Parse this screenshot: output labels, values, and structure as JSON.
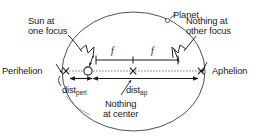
{
  "diagram": {
    "type": "geometry-diagram",
    "stroke_color": "#1a1a1a",
    "background_color": "#ffffff",
    "labels": {
      "sun": "Sun at\none focus",
      "sun_line1": "Sun at",
      "sun_line2": "one focus",
      "planet": "Planet",
      "nothing_other_focus_line1": "Nothing at",
      "nothing_other_focus_line2": "other focus",
      "perihelion": "Perihelion",
      "aphelion": "Aphelion",
      "dist_peri_base": "dist",
      "dist_peri_sub": "peri",
      "dist_ap_base": "dist",
      "dist_ap_sub": "ap",
      "nothing_center_line1": "Nothing",
      "nothing_center_line2": "at center",
      "focal_distance_left": "f",
      "focal_distance_right": "f"
    },
    "markers": {
      "sun_symbol": "open-circle",
      "planet_symbol": "open-circle",
      "center_symbol": "x-cross",
      "perihelion_symbol": "x-cross",
      "aphelion_symbol": "x-cross",
      "other_focus_symbol": "x-cross"
    },
    "geometry": {
      "ellipse_center_x": 133.5,
      "ellipse_center_y": 71.5,
      "ellipse_semi_major": 71.5,
      "ellipse_semi_minor": 59.5,
      "axis_y": 74,
      "left_focus_x": 88,
      "right_focus_x": 178,
      "perihelion_x": 66,
      "aphelion_x": 201,
      "planet_x": 168,
      "planet_y": 20,
      "f_bar_y": 60,
      "f_bar_left_x": 96,
      "f_bar_right_x": 178,
      "f_bar_mid_x": 133
    }
  }
}
